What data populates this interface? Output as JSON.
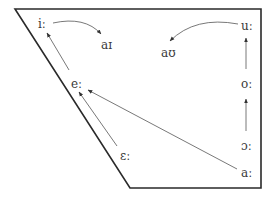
{
  "diagram": {
    "title": "",
    "type": "vowel-chart-trapezoid",
    "frame": {
      "top_left": [
        15,
        9
      ],
      "top_right": [
        261,
        9
      ],
      "bottom_right": [
        261,
        188
      ],
      "bottom_left": [
        130,
        188
      ]
    },
    "nodes": [
      {
        "id": "i",
        "label": "iː",
        "x": 42,
        "y": 27
      },
      {
        "id": "ai",
        "label": "aɪ",
        "x": 107,
        "y": 46
      },
      {
        "id": "au",
        "label": "aʊ",
        "x": 167,
        "y": 55
      },
      {
        "id": "u",
        "label": "uː",
        "x": 245,
        "y": 28
      },
      {
        "id": "e",
        "label": "eː",
        "x": 76,
        "y": 86
      },
      {
        "id": "o",
        "label": "oː",
        "x": 245,
        "y": 86
      },
      {
        "id": "epsilon",
        "label": "ɛː",
        "x": 126,
        "y": 157
      },
      {
        "id": "open_o",
        "label": "ɔː",
        "x": 245,
        "y": 146
      },
      {
        "id": "a",
        "label": "aː",
        "x": 245,
        "y": 173
      }
    ],
    "edges": [
      {
        "from": "i",
        "to": "ai",
        "style": "curved"
      },
      {
        "from": "u",
        "to": "au",
        "style": "curved"
      },
      {
        "from": "e",
        "to": "i",
        "style": "straight"
      },
      {
        "from": "epsilon",
        "to": "e",
        "style": "straight"
      },
      {
        "from": "a",
        "to": "e",
        "style": "straight"
      },
      {
        "from": "o",
        "to": "u",
        "style": "straight"
      },
      {
        "from": "open_o",
        "to": "o",
        "style": "straight"
      }
    ]
  }
}
